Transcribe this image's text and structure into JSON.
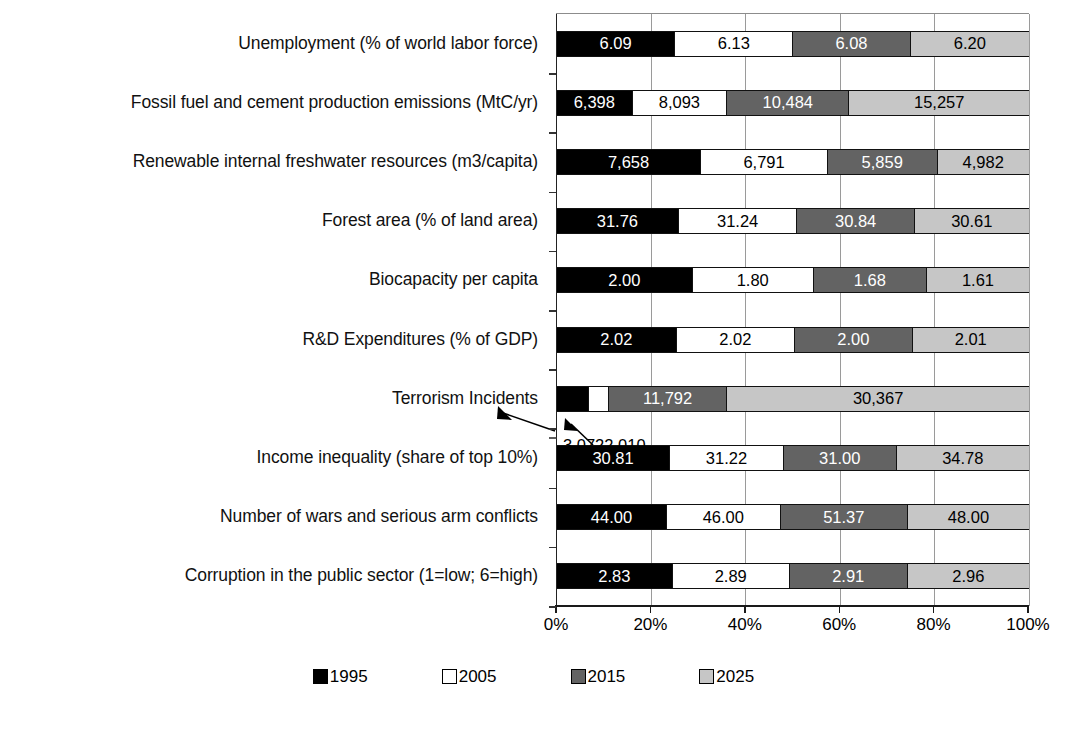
{
  "chart": {
    "type": "bar",
    "title": "",
    "xlabel": "",
    "ylabel": ""
  },
  "axis": {
    "ticks": [
      "0%",
      "20%",
      "40%",
      "60%",
      "80%",
      "100%"
    ],
    "tick_values": [
      0,
      20,
      40,
      60,
      80,
      100
    ]
  },
  "legend": {
    "items": [
      {
        "label": "1995",
        "color": "#000000",
        "swatch": "square-filled-black"
      },
      {
        "label": "2005",
        "color": "#ffffff",
        "swatch": "square-outline-white"
      },
      {
        "label": "2015",
        "color": "#636363",
        "swatch": "square-filled-darkgray"
      },
      {
        "label": "2025",
        "color": "#c6c6c6",
        "swatch": "square-filled-lightgray"
      }
    ]
  },
  "annotation": {
    "text": "3,0722,010",
    "value_1995": "3,072",
    "value_2005": "2,010"
  },
  "chart_data": {
    "type": "bar",
    "subtype": "100% stacked horizontal bar",
    "title": "",
    "xlabel": "",
    "ylabel": "",
    "xlim": [
      0,
      100
    ],
    "grid": true,
    "legend_position": "bottom",
    "series_names": [
      "1995",
      "2005",
      "2015",
      "2025"
    ],
    "series_colors": [
      "#000000",
      "#ffffff",
      "#636363",
      "#c6c6c6"
    ],
    "categories": [
      "Unemployment  (% of world labor force)",
      "Fossil fuel and cement production emissions (MtC/yr)",
      "Renewable internal freshwater resources (m3/capita)",
      "Forest area (% of land area)",
      "Biocapacity per capita",
      "R&D Expenditures (% of GDP)",
      "Terrorism Incidents",
      "Income inequality (share of top 10%)",
      "Number of wars and serious arm conflicts",
      "Corruption in the public sector (1=low; 6=high)"
    ],
    "series": [
      {
        "name": "1995",
        "values": [
          6.09,
          6398,
          7658,
          31.76,
          2.0,
          2.02,
          3072,
          30.81,
          44.0,
          2.83
        ]
      },
      {
        "name": "2005",
        "values": [
          6.13,
          8093,
          6791,
          31.24,
          1.8,
          2.02,
          2010,
          31.22,
          46.0,
          2.89
        ]
      },
      {
        "name": "2015",
        "values": [
          6.08,
          10484,
          5859,
          30.84,
          1.68,
          2.0,
          11792,
          31.0,
          51.37,
          2.91
        ]
      },
      {
        "name": "2025",
        "values": [
          6.2,
          15257,
          4982,
          30.61,
          1.61,
          2.01,
          30367,
          34.78,
          48.0,
          2.96
        ]
      }
    ],
    "rows": [
      {
        "category": "Unemployment  (% of world labor force)",
        "segments": [
          {
            "series": "1995",
            "label": "6.09",
            "value": 6.09,
            "pct": 24.87
          },
          {
            "series": "2005",
            "label": "6.13",
            "value": 6.13,
            "pct": 25.03
          },
          {
            "series": "2015",
            "label": "6.08",
            "value": 6.08,
            "pct": 24.83
          },
          {
            "series": "2025",
            "label": "6.20",
            "value": 6.2,
            "pct": 25.32
          }
        ]
      },
      {
        "category": "Fossil fuel and cement production emissions (MtC/yr)",
        "segments": [
          {
            "series": "1995",
            "label": "6,398",
            "value": 6398,
            "pct": 15.82
          },
          {
            "series": "2005",
            "label": "8,093",
            "value": 8093,
            "pct": 20.01
          },
          {
            "series": "2015",
            "label": "10,484",
            "value": 10484,
            "pct": 25.93
          },
          {
            "series": "2025",
            "label": "15,257",
            "value": 15257,
            "pct": 38.24
          }
        ]
      },
      {
        "category": "Renewable internal freshwater resources (m3/capita)",
        "segments": [
          {
            "series": "1995",
            "label": "7,658",
            "value": 7658,
            "pct": 30.32
          },
          {
            "series": "2005",
            "label": "6,791",
            "value": 6791,
            "pct": 26.89
          },
          {
            "series": "2015",
            "label": "5,859",
            "value": 5859,
            "pct": 23.2
          },
          {
            "series": "2025",
            "label": "4,982",
            "value": 4982,
            "pct": 19.59
          }
        ]
      },
      {
        "category": "Forest area (% of land area)",
        "segments": [
          {
            "series": "1995",
            "label": "31.76",
            "value": 31.76,
            "pct": 25.58
          },
          {
            "series": "2005",
            "label": "31.24",
            "value": 31.24,
            "pct": 25.16
          },
          {
            "series": "2015",
            "label": "30.84",
            "value": 30.84,
            "pct": 24.84
          },
          {
            "series": "2025",
            "label": "30.61",
            "value": 30.61,
            "pct": 24.42
          }
        ]
      },
      {
        "category": "Biocapacity per capita",
        "segments": [
          {
            "series": "1995",
            "label": "2.00",
            "value": 2.0,
            "pct": 28.53
          },
          {
            "series": "2005",
            "label": "1.80",
            "value": 1.8,
            "pct": 25.68
          },
          {
            "series": "2015",
            "label": "1.68",
            "value": 1.68,
            "pct": 23.97
          },
          {
            "series": "2025",
            "label": "1.61",
            "value": 1.61,
            "pct": 21.82
          }
        ]
      },
      {
        "category": "R&D Expenditures (% of GDP)",
        "segments": [
          {
            "series": "1995",
            "label": "2.02",
            "value": 2.02,
            "pct": 25.12
          },
          {
            "series": "2005",
            "label": "2.02",
            "value": 2.02,
            "pct": 25.12
          },
          {
            "series": "2015",
            "label": "2.00",
            "value": 2.0,
            "pct": 24.88
          },
          {
            "series": "2025",
            "label": "2.01",
            "value": 2.01,
            "pct": 24.88
          }
        ]
      },
      {
        "category": "Terrorism Incidents",
        "segments": [
          {
            "series": "1995",
            "label": "",
            "value": 3072,
            "pct": 6.53
          },
          {
            "series": "2005",
            "label": "",
            "value": 2010,
            "pct": 4.27
          },
          {
            "series": "2015",
            "label": "11,792",
            "value": 11792,
            "pct": 25.07
          },
          {
            "series": "2025",
            "label": "30,367",
            "value": 30367,
            "pct": 64.13
          }
        ]
      },
      {
        "category": "Income inequality (share of top 10%)",
        "segments": [
          {
            "series": "1995",
            "label": "30.81",
            "value": 30.81,
            "pct": 23.77
          },
          {
            "series": "2005",
            "label": "31.22",
            "value": 31.22,
            "pct": 24.08
          },
          {
            "series": "2015",
            "label": "31.00",
            "value": 31.0,
            "pct": 23.91
          },
          {
            "series": "2025",
            "label": "34.78",
            "value": 34.78,
            "pct": 28.24
          }
        ]
      },
      {
        "category": "Number of wars and serious arm conflicts",
        "segments": [
          {
            "series": "1995",
            "label": "44.00",
            "value": 44.0,
            "pct": 23.07
          },
          {
            "series": "2005",
            "label": "46.00",
            "value": 46.0,
            "pct": 24.12
          },
          {
            "series": "2015",
            "label": "51.37",
            "value": 51.37,
            "pct": 26.94
          },
          {
            "series": "2025",
            "label": "48.00",
            "value": 48.0,
            "pct": 25.87
          }
        ]
      },
      {
        "category": "Corruption in the public sector (1=low; 6=high)",
        "segments": [
          {
            "series": "1995",
            "label": "2.83",
            "value": 2.83,
            "pct": 24.3
          },
          {
            "series": "2005",
            "label": "2.89",
            "value": 2.89,
            "pct": 24.81
          },
          {
            "series": "2015",
            "label": "2.91",
            "value": 2.91,
            "pct": 24.98
          },
          {
            "series": "2025",
            "label": "2.96",
            "value": 2.96,
            "pct": 25.91
          }
        ]
      }
    ]
  }
}
